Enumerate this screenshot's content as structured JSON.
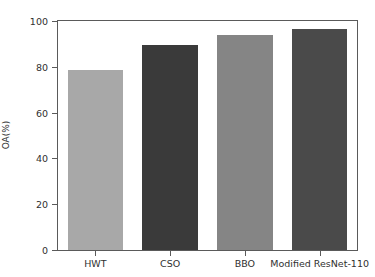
{
  "chart_data": {
    "type": "bar",
    "title": "",
    "xlabel": "",
    "ylabel": "OA(%)",
    "categories": [
      "HWT",
      "CSO",
      "BBO",
      "Modified ResNet-110"
    ],
    "values": [
      78.6,
      89.5,
      93.9,
      96.5
    ],
    "bar_colors": [
      "#a8a8a8",
      "#3a3a3a",
      "#858585",
      "#4a4a4a"
    ],
    "ylim": [
      0,
      100
    ],
    "yticks": [
      0,
      20,
      40,
      60,
      80,
      100
    ],
    "ytick_labels": [
      "0",
      "20",
      "40",
      "60",
      "80",
      "100"
    ],
    "grid": false,
    "legend": "none",
    "frame_color": "#5a5a5a",
    "background": "#ffffff"
  }
}
